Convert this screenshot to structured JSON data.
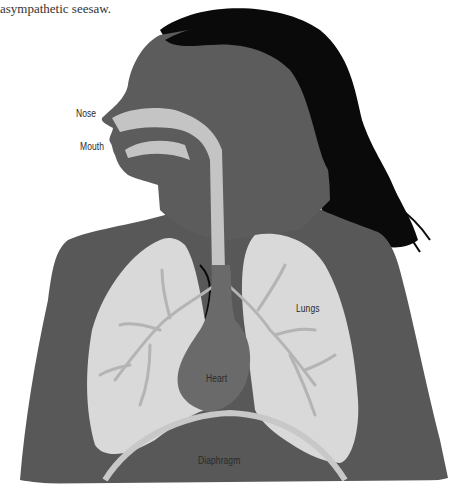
{
  "intro_text": {
    "line_partial": "... body's sympathetic and parasympathetic ...",
    "line": "asympathetic seesaw."
  },
  "illustration": {
    "subject": "respiratory-system-diagram",
    "colors": {
      "skin": "#585858",
      "hair": "#0a0a0a",
      "airway": "#c4c4c4",
      "lungs": "#d9d9d9",
      "bronchi": "#b4b4b4",
      "heart": "#6a6a6a",
      "diaphragm_line": "#c8c8c8"
    },
    "labels": {
      "nose": "Nose",
      "mouth": "Mouth",
      "lungs": "Lungs",
      "heart": "Heart",
      "diaphragm": "Diaphragm"
    }
  }
}
